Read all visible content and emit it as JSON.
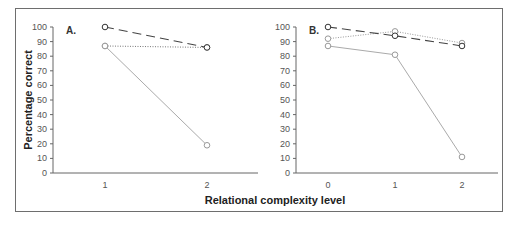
{
  "chart_data": [
    {
      "panel": "A.",
      "type": "line",
      "title": "",
      "xlabel": "Relational complexity level",
      "ylabel": "Percentage correct",
      "ylim": [
        0,
        100
      ],
      "yticks": [
        0,
        10,
        20,
        30,
        40,
        50,
        60,
        70,
        80,
        90,
        100
      ],
      "categories": [
        "1",
        "2"
      ],
      "x": [
        1,
        2
      ],
      "grid": false,
      "legend": null,
      "series": [
        {
          "name": "dashed-dark",
          "style": "dashed",
          "color": "#444444",
          "values": [
            100,
            86
          ]
        },
        {
          "name": "dotted",
          "style": "dotted",
          "color": "#777777",
          "values": [
            87,
            86
          ]
        },
        {
          "name": "solid-gray",
          "style": "solid",
          "color": "#aaaaaa",
          "values": [
            87,
            19
          ]
        }
      ]
    },
    {
      "panel": "B.",
      "type": "line",
      "title": "",
      "xlabel": "Relational complexity level",
      "ylabel": "Percentage correct",
      "ylim": [
        0,
        100
      ],
      "yticks": [
        0,
        10,
        20,
        30,
        40,
        50,
        60,
        70,
        80,
        90,
        100
      ],
      "categories": [
        "0",
        "1",
        "2"
      ],
      "x": [
        0,
        1,
        2
      ],
      "grid": false,
      "legend": null,
      "series": [
        {
          "name": "dashed-dark",
          "style": "dashed",
          "color": "#444444",
          "values": [
            100,
            94,
            87
          ]
        },
        {
          "name": "dotted",
          "style": "dotted",
          "color": "#999999",
          "values": [
            92,
            97,
            89
          ]
        },
        {
          "name": "solid-gray",
          "style": "solid",
          "color": "#aaaaaa",
          "values": [
            87,
            81,
            11
          ]
        }
      ]
    }
  ],
  "labels": {
    "ylabel": "Percentage correct",
    "xlabel": "Relational complexity level",
    "panel_a": "A.",
    "panel_b": "B."
  }
}
